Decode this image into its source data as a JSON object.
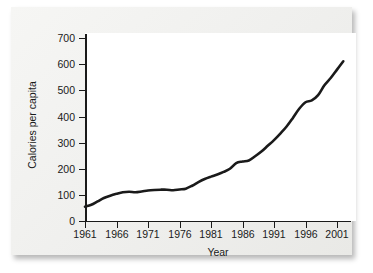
{
  "chart_data": {
    "type": "line",
    "title": "",
    "xlabel": "Year",
    "ylabel": "Calories per capita",
    "xlim": [
      1961,
      2002
    ],
    "ylim": [
      0,
      700
    ],
    "grid": false,
    "legend": null,
    "x_ticks": [
      "1961",
      "1966",
      "1971",
      "1976",
      "1981",
      "1986",
      "1991",
      "1996",
      "2001"
    ],
    "y_ticks": [
      "0",
      "100",
      "200",
      "300",
      "400",
      "500",
      "600",
      "700"
    ],
    "line_color": "#1a1a1a",
    "series": [
      {
        "name": "Calories per capita",
        "x": [
          1961,
          1962,
          1963,
          1964,
          1965,
          1966,
          1967,
          1968,
          1969,
          1970,
          1971,
          1972,
          1973,
          1974,
          1975,
          1976,
          1977,
          1978,
          1979,
          1980,
          1981,
          1982,
          1983,
          1984,
          1985,
          1986,
          1987,
          1988,
          1989,
          1990,
          1991,
          1992,
          1993,
          1994,
          1995,
          1996,
          1997,
          1998,
          1999,
          2000,
          2001,
          2002
        ],
        "values": [
          55,
          62,
          75,
          88,
          97,
          104,
          110,
          112,
          110,
          113,
          117,
          119,
          120,
          120,
          118,
          121,
          124,
          135,
          149,
          161,
          170,
          178,
          188,
          200,
          222,
          228,
          232,
          248,
          266,
          288,
          310,
          335,
          362,
          395,
          430,
          455,
          462,
          482,
          520,
          548,
          580,
          612
        ]
      }
    ]
  },
  "axes": {
    "x_title": "Year",
    "y_title": "Calories per capita"
  }
}
